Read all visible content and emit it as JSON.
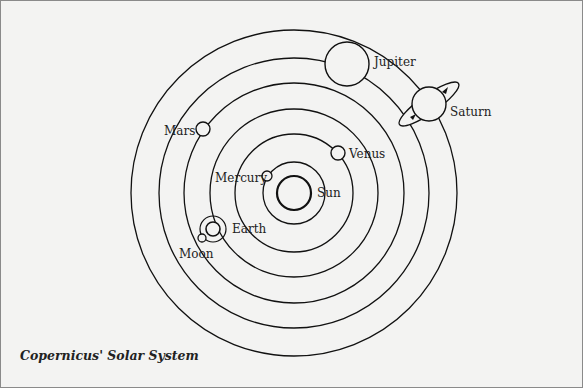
{
  "caption": "Copernicus' Solar System",
  "colors": {
    "background": "#f3f3f2",
    "line": "#111111",
    "text": "#222222"
  },
  "center": {
    "x": 293,
    "y": 192
  },
  "sun": {
    "label": "Sun",
    "r": 17
  },
  "orbits": [
    31,
    59,
    84,
    110,
    135,
    163
  ],
  "bodies": [
    {
      "name": "Mercury",
      "label": "Mercury"
    },
    {
      "name": "Venus",
      "label": "Venus"
    },
    {
      "name": "Earth",
      "label": "Earth"
    },
    {
      "name": "Moon",
      "label": "Moon"
    },
    {
      "name": "Mars",
      "label": "Mars"
    },
    {
      "name": "Jupiter",
      "label": "Jupiter"
    },
    {
      "name": "Saturn",
      "label": "Saturn"
    }
  ]
}
